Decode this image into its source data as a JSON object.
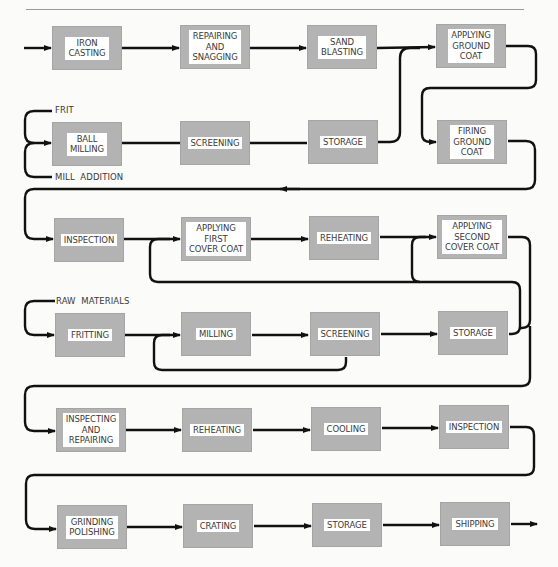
{
  "header": {
    "page_number": "126"
  },
  "diagram": {
    "rows": [
      {
        "steps": [
          "IRON\nCASTING",
          "REPAIRING\nAND\nSNAGGING",
          "SAND\nBLASTING",
          "APPLYING\nGROUND\nCOAT"
        ]
      },
      {
        "steps": [
          "BALL\nMILLING",
          "SCREENING",
          "STORAGE",
          "FIRING\nGROUND\nCOAT"
        ],
        "inputs": [
          "FRIT",
          "MILL  ADDITION"
        ]
      },
      {
        "steps": [
          "INSPECTION",
          "APPLYING\nFIRST\nCOVER  COAT",
          "REHEATING",
          "APPLYING\nSECOND\nCOVER  COAT"
        ]
      },
      {
        "steps": [
          "FRITTING",
          "MILLING",
          "SCREENING",
          "STORAGE"
        ],
        "inputs": [
          "RAW  MATERIALS"
        ]
      },
      {
        "steps": [
          "INSPECTING\nAND\nREPAIRING",
          "REHEATING",
          "COOLING",
          "INSPECTION"
        ]
      },
      {
        "steps": [
          "GRINDING\nPOLISHING",
          "CRATING",
          "STORAGE",
          "SHIPPING"
        ]
      }
    ]
  },
  "colors": {
    "box_fill": "#b3b3b3",
    "label_bg": "#ffffff",
    "line": "#111111",
    "text": "#3a3a3a"
  }
}
